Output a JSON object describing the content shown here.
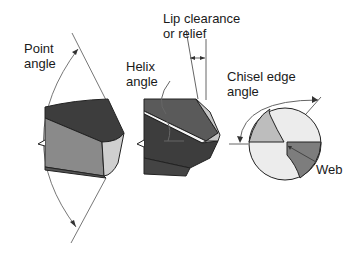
{
  "diagram": {
    "type": "technical-illustration",
    "labels": {
      "point_angle": "Point\nangle",
      "lip_clearance": "Lip clearance\nor relief",
      "helix_angle": "Helix\nangle",
      "chisel_edge_angle": "Chisel edge\nangle",
      "web": "Web"
    },
    "colors": {
      "dark": "#3d3d3d",
      "medium": "#8a8a8a",
      "light": "#c8c8c8",
      "lightest": "#ececec",
      "line": "#555555"
    }
  }
}
